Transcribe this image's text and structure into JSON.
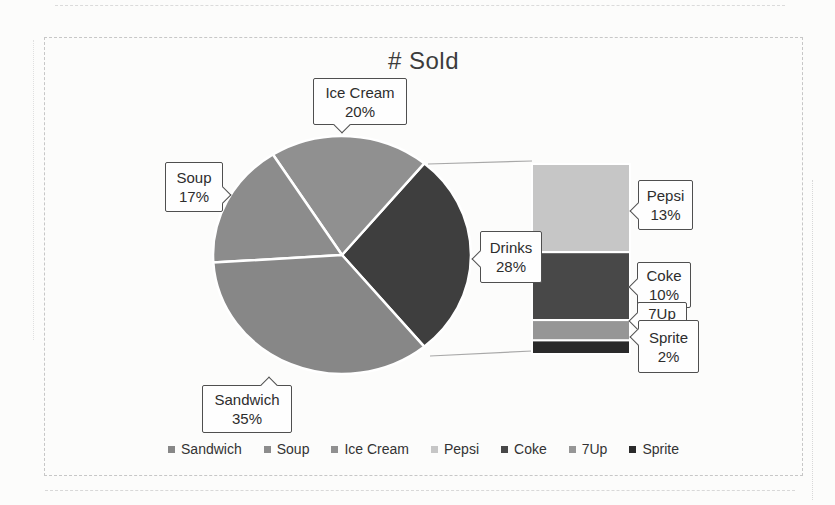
{
  "title": "# Sold",
  "chart_data": {
    "type": "pie",
    "variant": "bar-of-pie",
    "title": "# Sold",
    "unit": "percent",
    "slices": [
      {
        "name": "Sandwich",
        "value": 35
      },
      {
        "name": "Soup",
        "value": 17
      },
      {
        "name": "Ice Cream",
        "value": 20
      },
      {
        "name": "Drinks",
        "value": 28
      }
    ],
    "breakout": {
      "parent": "Drinks",
      "items": [
        {
          "name": "Pepsi",
          "value": 13
        },
        {
          "name": "Coke",
          "value": 10
        },
        {
          "name": "7Up",
          "value": 3
        },
        {
          "name": "Sprite",
          "value": 2
        }
      ]
    },
    "legend": [
      "Sandwich",
      "Soup",
      "Ice Cream",
      "Pepsi",
      "Coke",
      "7Up",
      "Sprite"
    ],
    "legend_position": "bottom",
    "grid": false
  },
  "callouts": {
    "ice_cream": {
      "name": "Ice Cream",
      "pct": "20%"
    },
    "soup": {
      "name": "Soup",
      "pct": "17%"
    },
    "sandwich": {
      "name": "Sandwich",
      "pct": "35%"
    },
    "drinks": {
      "name": "Drinks",
      "pct": "28%"
    },
    "pepsi": {
      "name": "Pepsi",
      "pct": "13%"
    },
    "coke": {
      "name": "Coke",
      "pct": "10%"
    },
    "sevenup": {
      "name": "7Up"
    },
    "sprite": {
      "name": "Sprite",
      "pct": "2%"
    }
  },
  "colors": {
    "Sandwich": "#878787",
    "Soup": "#8c8c8c",
    "Ice Cream": "#909090",
    "Drinks": "#3e3e3e",
    "Pepsi": "#c6c6c6",
    "Coke": "#484848",
    "7Up": "#969696",
    "Sprite": "#2a2a2a",
    "connector": "#a8a8a8",
    "slice_separator": "#ffffff",
    "callout_border": "#4f4f4f",
    "title_text": "#3c3c3c"
  }
}
